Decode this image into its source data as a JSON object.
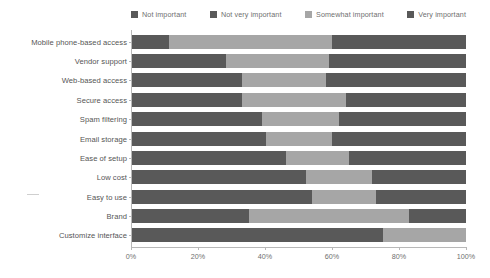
{
  "chart_data": {
    "type": "bar",
    "orientation": "horizontal",
    "stacked": true,
    "normalized": true,
    "title": "",
    "subtitle": "",
    "xlabel": "",
    "ylabel": "",
    "xlim": [
      0,
      100
    ],
    "xticks": [
      "0%",
      "20%",
      "40%",
      "60%",
      "80%",
      "100%"
    ],
    "xtick_values": [
      0,
      20,
      40,
      60,
      80,
      100
    ],
    "grid": false,
    "legend_position": "top",
    "categories": [
      "Mobile phone-based access",
      "Vendor support",
      "Web-based access",
      "Secure access",
      "Spam filtering",
      "Email storage",
      "Ease of setup",
      "Low cost",
      "Easy to use",
      "Brand",
      "Customize interface"
    ],
    "series": [
      {
        "name": "Not important",
        "color": "#595959",
        "values": [
          11,
          5,
          2,
          2,
          2,
          2,
          1,
          1,
          1,
          4,
          0
        ]
      },
      {
        "name": "Not very important",
        "color": "#595959",
        "values": [
          0,
          23,
          31,
          31,
          37,
          38,
          45,
          51,
          53,
          31,
          75
        ]
      },
      {
        "name": "Somewhat important",
        "color": "#a6a6a6",
        "values": [
          49,
          31,
          25,
          31,
          23,
          20,
          19,
          20,
          19,
          48,
          25
        ]
      },
      {
        "name": "Very important",
        "color": "#595959",
        "values": [
          40,
          41,
          42,
          36,
          38,
          40,
          35,
          28,
          27,
          17,
          0
        ]
      }
    ]
  },
  "legend": {
    "items": [
      {
        "label": "Not important"
      },
      {
        "label": "Not very important"
      },
      {
        "label": "Somewhat important"
      },
      {
        "label": "Very important"
      }
    ]
  },
  "colors": {
    "dark_gray": "#595959",
    "mid_gray": "#8c8c8c",
    "light_gray": "#a6a6a6",
    "axis": "#b8b8b8",
    "label_text": "#555555",
    "tick_text": "#6f6f6f",
    "background": "#ffffff"
  }
}
